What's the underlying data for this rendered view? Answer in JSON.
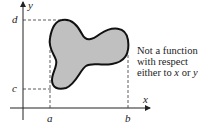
{
  "figure": {
    "axes": {
      "x_label": "x",
      "y_label": "y"
    },
    "bounds_labels": {
      "a": "a",
      "b": "b",
      "c": "c",
      "d": "d"
    },
    "region": {
      "fill_color": "#c0c0c0",
      "stroke_color": "#111111"
    },
    "caption": {
      "line1": "Not a function",
      "line2": "with respect",
      "line3_prefix": "either to ",
      "line3_x": "x",
      "line3_mid": " or ",
      "line3_y": "y"
    }
  }
}
